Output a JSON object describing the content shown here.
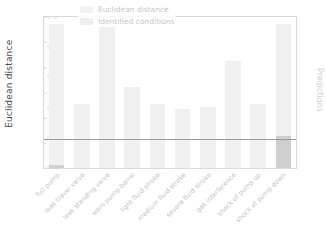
{
  "chart_data": {
    "type": "bar",
    "title": "",
    "xlabel": "",
    "ylabel": "Euclidean distance",
    "y2label": "Predictions",
    "ylim": [
      0.0,
      3.0
    ],
    "y2lim": [
      0.0,
      1.0
    ],
    "grid": false,
    "legend_position": "upper center",
    "categories": [
      "full pump",
      "leak travel valve",
      "leak standing valve",
      "worn pump barrel",
      "light fluid stroke",
      "medium fluid stroke",
      "severe fluid stroke",
      "gas interference",
      "shock of pump up",
      "shock of pump down"
    ],
    "yticks": [
      "3.0",
      "2.5",
      "2.0",
      "1.5",
      "1.0",
      "0.5",
      "0.0"
    ],
    "ytick_values": [
      3.0,
      2.5,
      2.0,
      1.5,
      1.0,
      0.5,
      0.0
    ],
    "y2ticks": [
      "1.0",
      "0.8",
      "0.6",
      "0.4",
      "0.2",
      "0.0"
    ],
    "y2tick_values": [
      1.0,
      0.8,
      0.6,
      0.4,
      0.2,
      0.0
    ],
    "threshold": 0.57,
    "series": [
      {
        "name": "Euclidean distance",
        "axis": "left",
        "color": "#f0f0f0",
        "values": [
          2.87,
          1.28,
          2.87,
          1.6,
          1.28,
          1.17,
          1.22,
          2.13,
          1.28,
          2.87
        ]
      },
      {
        "name": "Identified conditions",
        "axis": "right",
        "color": "#cfcfcf",
        "values": [
          0.02,
          0.0,
          0.0,
          0.0,
          0.0,
          0.0,
          0.0,
          0.0,
          0.0,
          0.21
        ]
      }
    ]
  },
  "legend": {
    "items": [
      {
        "label": "Euclidean distance"
      },
      {
        "label": "Identified conditions"
      }
    ]
  },
  "axes": {
    "left_title": "Euclidean distance",
    "right_title": "Predictions"
  }
}
